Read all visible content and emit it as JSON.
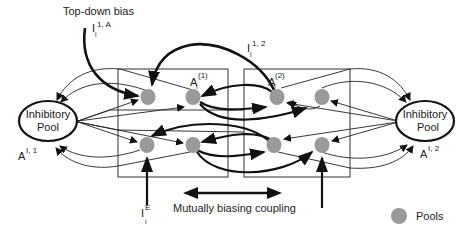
{
  "diagram": {
    "labels": {
      "top_down_bias": "Top-down bias",
      "input_top": {
        "base": "I",
        "sub": "i",
        "sup": "1, A"
      },
      "input_cross": {
        "base": "I",
        "sub": "i",
        "sup": "1, 2"
      },
      "input_external": {
        "base": "I",
        "sub": "i",
        "sup": "E"
      },
      "module1_activity": {
        "base": "A",
        "sub": "i",
        "sup": "(1)"
      },
      "module2_activity": {
        "base": "A",
        "sub": "i",
        "sup": "(2)"
      },
      "inhib_left_activity": {
        "base": "A",
        "sup": "I, 1"
      },
      "inhib_right_activity": {
        "base": "A",
        "sup": "I, 2"
      },
      "coupling": "Mutually biasing coupling",
      "legend_pools": "Pools"
    },
    "inhibitory_pools": [
      {
        "id": "left",
        "line1": "Inhibitory",
        "line2": "Pool"
      },
      {
        "id": "right",
        "line1": "Inhibitory",
        "line2": "Pool"
      }
    ],
    "modules": [
      {
        "id": "module-1",
        "pools": 4
      },
      {
        "id": "module-2",
        "pools": 4
      }
    ],
    "colors": {
      "pool_fill": "#9a9a9a",
      "line": "#111111",
      "box": "#333333"
    }
  }
}
